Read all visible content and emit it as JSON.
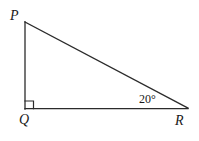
{
  "figure": {
    "name": "right-triangle-pqr",
    "width": 199,
    "height": 141,
    "background_color": "#ffffff",
    "stroke_color": "#2b2b2b",
    "stroke_width": 1.3
  },
  "vertices": {
    "p": {
      "label": "P",
      "x": 25,
      "y": 22
    },
    "q": {
      "label": "Q",
      "x": 25,
      "y": 109
    },
    "r": {
      "label": "R",
      "x": 188,
      "y": 108
    }
  },
  "sides": {
    "pq": {
      "name": "leg-pq",
      "from": "p",
      "to": "q"
    },
    "qr": {
      "name": "leg-qr",
      "from": "q",
      "to": "r"
    },
    "pr": {
      "name": "hypotenuse-pr",
      "from": "p",
      "to": "r"
    }
  },
  "angles": {
    "q": {
      "label": "",
      "value": "90",
      "marker": "right-angle-square"
    },
    "r": {
      "label": "20°",
      "value": "20"
    }
  },
  "right_angle_marker": {
    "size": 8,
    "x": 25,
    "y": 101
  }
}
